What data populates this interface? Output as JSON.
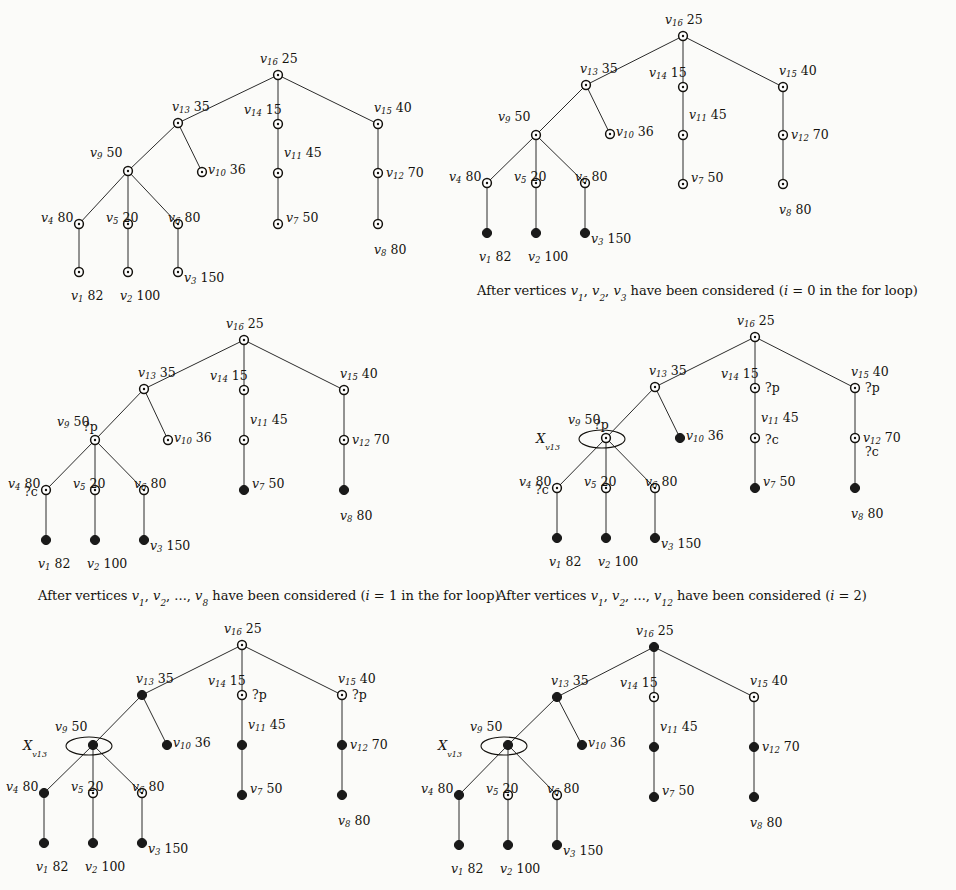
{
  "figure": {
    "title_visible": false,
    "vertex_info": {
      "v1": {
        "label": "v",
        "index": "1",
        "value": "82"
      },
      "v2": {
        "label": "v",
        "index": "2",
        "value": "100"
      },
      "v3": {
        "label": "v",
        "index": "3",
        "value": "150"
      },
      "v4": {
        "label": "v",
        "index": "4",
        "value": "80"
      },
      "v5": {
        "label": "v",
        "index": "5",
        "value": "20"
      },
      "v6": {
        "label": "v",
        "index": "6",
        "value": "80"
      },
      "v7": {
        "label": "v",
        "index": "7",
        "value": "50"
      },
      "v8": {
        "label": "v",
        "index": "8",
        "value": "80"
      },
      "v9": {
        "label": "v",
        "index": "9",
        "value": "50"
      },
      "v10": {
        "label": "v",
        "index": "10",
        "value": "36"
      },
      "v11": {
        "label": "v",
        "index": "11",
        "value": "45"
      },
      "v12": {
        "label": "v",
        "index": "12",
        "value": "70"
      },
      "v13": {
        "label": "v",
        "index": "13",
        "value": "35"
      },
      "v14": {
        "label": "v",
        "index": "14",
        "value": "15"
      },
      "v15": {
        "label": "v",
        "index": "15",
        "value": "40"
      },
      "v16": {
        "label": "v",
        "index": "16",
        "value": "25"
      }
    },
    "edges": [
      [
        "v16",
        "v13"
      ],
      [
        "v16",
        "v14"
      ],
      [
        "v16",
        "v15"
      ],
      [
        "v13",
        "v9"
      ],
      [
        "v13",
        "v10"
      ],
      [
        "v9",
        "v4"
      ],
      [
        "v9",
        "v5"
      ],
      [
        "v9",
        "v6"
      ],
      [
        "v4",
        "v1"
      ],
      [
        "v5",
        "v2"
      ],
      [
        "v6",
        "v3"
      ],
      [
        "v14",
        "v11"
      ],
      [
        "v11",
        "v7"
      ],
      [
        "v15",
        "v12"
      ],
      [
        "v12",
        "v8"
      ]
    ],
    "markers": {
      "parent": "?p",
      "child": "?c",
      "ellipse_label": "X",
      "ellipse_sub": "v13"
    },
    "captions": {
      "panel1": "",
      "panel2": {
        "prefix": "After vertices ",
        "list": [
          "v1",
          "v2",
          "v3"
        ],
        "middle": " have been considered (",
        "condition": "i = 0",
        "suffix": " in the for loop)"
      },
      "panel3": {
        "prefix": "After vertices ",
        "list": [
          "v1",
          "v2",
          "...",
          "v8"
        ],
        "middle": " have been considered (",
        "condition": "i = 1",
        "suffix": " in the for loop)"
      },
      "panel4": {
        "prefix": "After vertices ",
        "list": [
          "v1",
          "v2",
          "...",
          "v12"
        ],
        "middle": " have been considered (",
        "condition": "i = 2",
        "suffix": ")"
      }
    },
    "panels": [
      {
        "id": "panel-1",
        "filled": [],
        "ellipse": false,
        "marks": []
      },
      {
        "id": "panel-2",
        "filled": [
          "v1",
          "v2",
          "v3"
        ],
        "ellipse": false,
        "marks": []
      },
      {
        "id": "panel-3",
        "filled": [
          "v1",
          "v2",
          "v3",
          "v7",
          "v8"
        ],
        "ellipse": false,
        "marks": [
          {
            "at": "v9",
            "text": "?p"
          },
          {
            "at": "v4",
            "text": "?c"
          }
        ]
      },
      {
        "id": "panel-4",
        "filled": [
          "v1",
          "v2",
          "v3",
          "v7",
          "v8",
          "v10"
        ],
        "ellipse": true,
        "marks": [
          {
            "at": "v9",
            "text": "?p"
          },
          {
            "at": "v4",
            "text": "?c"
          },
          {
            "at": "v14",
            "text": "?p"
          },
          {
            "at": "v15",
            "text": "?p"
          },
          {
            "at": "v11",
            "text": "?c"
          },
          {
            "at": "v12",
            "text": "?c"
          }
        ]
      },
      {
        "id": "panel-5",
        "filled": [
          "v1",
          "v2",
          "v3",
          "v4",
          "v7",
          "v8",
          "v9",
          "v10",
          "v11",
          "v12",
          "v13"
        ],
        "ellipse": true,
        "marks": [
          {
            "at": "v14",
            "text": "?p"
          },
          {
            "at": "v15",
            "text": "?p"
          }
        ]
      },
      {
        "id": "panel-6",
        "filled": [
          "v1",
          "v2",
          "v3",
          "v4",
          "v7",
          "v8",
          "v9",
          "v10",
          "v11",
          "v12",
          "v13",
          "v16"
        ],
        "ellipse": true,
        "marks": []
      }
    ]
  },
  "colors": {
    "ink": "#15130f",
    "node_fill_open": "#ffffff",
    "node_fill_solid": "#1a1a1a",
    "edge": "#2b2b2b",
    "background": "#fbfbf9"
  }
}
